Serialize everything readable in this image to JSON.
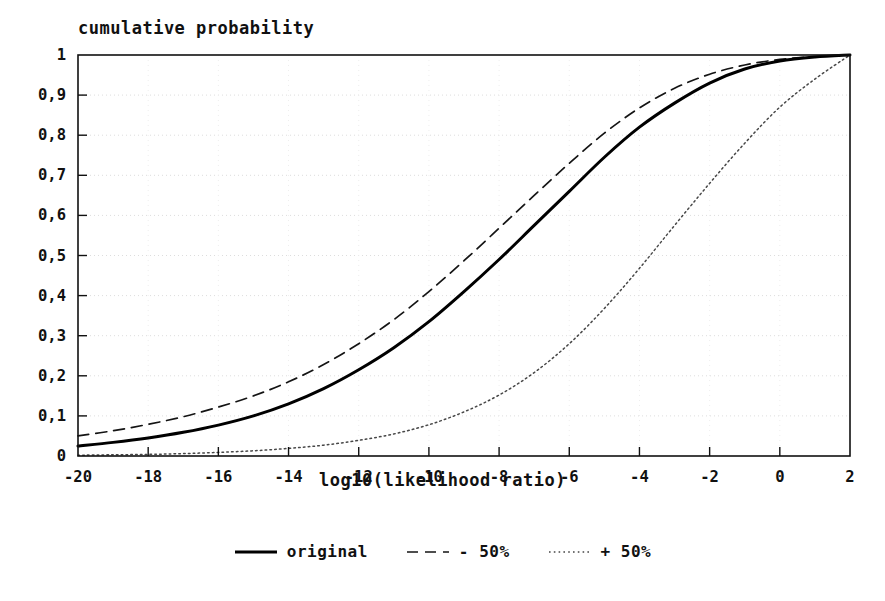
{
  "chart_data": {
    "type": "line",
    "title": "",
    "ylabel": "cumulative probability",
    "xlabel": "log10(likelihood ratio)",
    "xlim": [
      -20,
      2
    ],
    "ylim": [
      0,
      1
    ],
    "grid": true,
    "legend_position": "bottom",
    "xticks": [
      -20,
      -18,
      -16,
      -14,
      -12,
      -10,
      -8,
      -6,
      -4,
      -2,
      0,
      2
    ],
    "xtick_labels": [
      "-20",
      "-18",
      "-16",
      "-14",
      "-12",
      "-10",
      "-8",
      "-6",
      "-4",
      "-2",
      "0",
      "2"
    ],
    "yticks": [
      0,
      0.1,
      0.2,
      0.3,
      0.4,
      0.5,
      0.6,
      0.7,
      0.8,
      0.9,
      1
    ],
    "ytick_labels": [
      "0",
      "0,1",
      "0,2",
      "0,3",
      "0,4",
      "0,5",
      "0,6",
      "0,7",
      "0,8",
      "0,9",
      "1"
    ],
    "x": [
      -20,
      -19,
      -18,
      -17,
      -16,
      -15,
      -14,
      -13,
      -12,
      -11,
      -10,
      -9,
      -8,
      -7,
      -6,
      -5,
      -4,
      -3,
      -2,
      -1,
      0,
      1,
      2
    ],
    "series": [
      {
        "name": "original",
        "style": "solid",
        "color": "#000000",
        "values": [
          0.025,
          0.034,
          0.045,
          0.059,
          0.077,
          0.1,
          0.13,
          0.168,
          0.215,
          0.27,
          0.335,
          0.41,
          0.49,
          0.575,
          0.66,
          0.745,
          0.82,
          0.88,
          0.93,
          0.965,
          0.985,
          0.995,
          1.0
        ]
      },
      {
        "name": "- 50%",
        "style": "dashed",
        "color": "#000000",
        "values": [
          0.05,
          0.063,
          0.079,
          0.098,
          0.122,
          0.15,
          0.185,
          0.228,
          0.28,
          0.34,
          0.41,
          0.487,
          0.568,
          0.65,
          0.73,
          0.805,
          0.868,
          0.917,
          0.952,
          0.975,
          0.989,
          0.996,
          1.0
        ]
      },
      {
        "name": "+ 50%",
        "style": "dotted",
        "color": "#000000",
        "values": [
          0.002,
          0.003,
          0.004,
          0.006,
          0.009,
          0.013,
          0.019,
          0.027,
          0.039,
          0.055,
          0.078,
          0.11,
          0.152,
          0.208,
          0.28,
          0.368,
          0.468,
          0.575,
          0.68,
          0.78,
          0.87,
          0.94,
          1.0
        ]
      }
    ]
  },
  "legend": {
    "items": [
      {
        "label": "original",
        "style": "solid"
      },
      {
        "label": "- 50%",
        "style": "dashed"
      },
      {
        "label": "+ 50%",
        "style": "dotted"
      }
    ]
  }
}
